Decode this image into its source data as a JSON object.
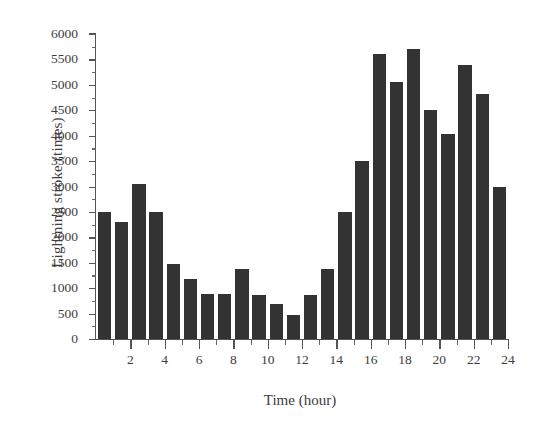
{
  "chart_data": {
    "type": "bar",
    "title": "",
    "subtitle": "",
    "xlabel": "Time (hour)",
    "ylabel": "Lightning stroke (times)",
    "xlim": [
      0,
      24
    ],
    "ylim": [
      0,
      6000
    ],
    "grid": false,
    "legend": null,
    "bar_color": "#333333",
    "axis_color": "#555555",
    "x_tick_labels": [
      "2",
      "4",
      "6",
      "8",
      "10",
      "12",
      "14",
      "16",
      "18",
      "20",
      "22",
      "24"
    ],
    "x_tick_values": [
      2,
      4,
      6,
      8,
      10,
      12,
      14,
      16,
      18,
      20,
      22,
      24
    ],
    "x_minor_tick_values": [
      1,
      3,
      5,
      7,
      9,
      11,
      13,
      15,
      17,
      19,
      21,
      23
    ],
    "y_tick_labels": [
      "0",
      "500",
      "1000",
      "1500",
      "2000",
      "2500",
      "3000",
      "3500",
      "4000",
      "4500",
      "5000",
      "5500",
      "6000"
    ],
    "y_tick_values": [
      0,
      500,
      1000,
      1500,
      2000,
      2500,
      3000,
      3500,
      4000,
      4500,
      5000,
      5500,
      6000
    ],
    "y_minor_tick_values": [
      250,
      750,
      1250,
      1750,
      2250,
      2750,
      3250,
      3750,
      4250,
      4750,
      5250,
      5750
    ],
    "categories": [
      "0",
      "1",
      "2",
      "3",
      "4",
      "5",
      "6",
      "7",
      "8",
      "9",
      "10",
      "11",
      "12",
      "13",
      "14",
      "15",
      "16",
      "17",
      "18",
      "19",
      "20",
      "21",
      "22",
      "23"
    ],
    "values": [
      2500,
      2300,
      3050,
      2500,
      1480,
      1180,
      880,
      880,
      1380,
      860,
      690,
      470,
      870,
      1380,
      2500,
      3500,
      5600,
      5050,
      5700,
      4500,
      4030,
      5400,
      4820,
      3000
    ]
  }
}
